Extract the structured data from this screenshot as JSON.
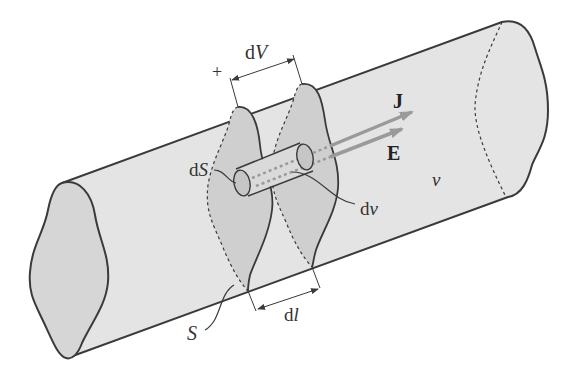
{
  "figure": {
    "colors": {
      "background": "#ffffff",
      "tube_fill": "#e4e4e4",
      "section_fill": "#cfcfcf",
      "cap_fill": "#c6c6c6",
      "outline": "#3a3a3a",
      "arrow": "#9a9a9a"
    },
    "labels": {
      "plus": "+",
      "dV_d": "d",
      "dV_V": "V",
      "J": "J",
      "E": "E",
      "dS_d": "d",
      "dS_S": "S",
      "dv_d": "d",
      "dv_v": "v",
      "v": "v",
      "S": "S",
      "dl_d": "d",
      "dl_l": "l"
    }
  }
}
